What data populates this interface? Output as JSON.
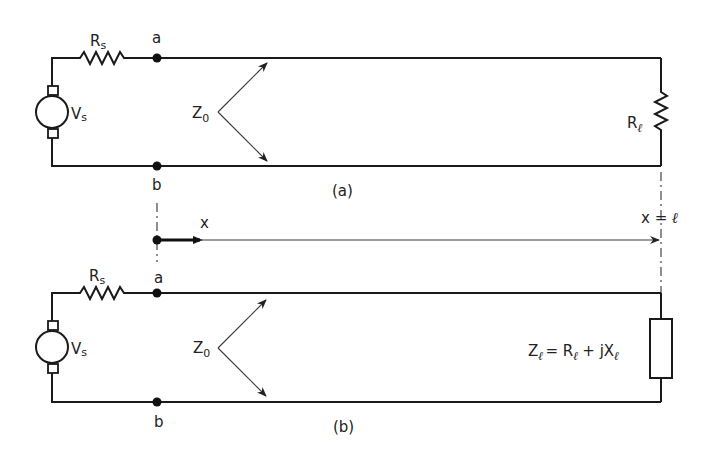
{
  "figure": {
    "panel_a": {
      "caption": "(a)",
      "source": {
        "label": "V",
        "subscript": "s"
      },
      "source_resistor": {
        "label": "R",
        "subscript": "s"
      },
      "node_top": "a",
      "node_bottom": "b",
      "line_impedance": {
        "label": "Z",
        "subscript": "0"
      },
      "load": {
        "label": "R",
        "subscript": "ℓ",
        "type": "resistor"
      }
    },
    "axis": {
      "label": "x",
      "end_label": "x = ",
      "end_symbol": "ℓ"
    },
    "panel_b": {
      "caption": "(b)",
      "source": {
        "label": "V",
        "subscript": "s"
      },
      "source_resistor": {
        "label": "R",
        "subscript": "s"
      },
      "node_top": "a",
      "node_bottom": "b",
      "line_impedance": {
        "label": "Z",
        "subscript": "0"
      },
      "load": {
        "type": "impedance",
        "eq_Z": "Z",
        "eq_eq": "= R",
        "eq_plus": "+ jX",
        "ell": "ℓ"
      }
    }
  }
}
